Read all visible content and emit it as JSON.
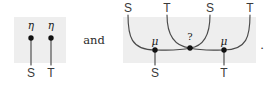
{
  "figure": {
    "type": "string-diagram-pair",
    "conjunction": "and",
    "terminator": ".",
    "background_color": "#ffffff",
    "panel_color": "#eeeeee",
    "stroke_color": "#3a3a3a",
    "node_color": "#111111"
  },
  "left_diagram": {
    "name": "unit-diagram",
    "panel": {
      "x": 14,
      "y": 17,
      "width": 52,
      "height": 46
    },
    "top_nodes": [
      {
        "label": "η",
        "name": "eta-node-s",
        "x": 31,
        "y": 38
      },
      {
        "label": "η",
        "name": "eta-node-t",
        "x": 51,
        "y": 38
      }
    ],
    "bottom_labels": [
      {
        "label": "S",
        "name": "output-label-s",
        "x": 31,
        "y": 72
      },
      {
        "label": "T",
        "name": "output-label-t",
        "x": 51,
        "y": 72
      }
    ],
    "wires": [
      {
        "name": "wire-eta-s",
        "from": [
          31,
          38
        ],
        "to": [
          31,
          65
        ]
      },
      {
        "name": "wire-eta-t",
        "from": [
          51,
          38
        ],
        "to": [
          51,
          65
        ]
      }
    ]
  },
  "right_diagram": {
    "name": "multiplication-diagram",
    "panel": {
      "x": 123,
      "y": 17,
      "width": 133,
      "height": 46
    },
    "top_labels": [
      {
        "label": "S",
        "name": "input-label-s1",
        "x": 128,
        "y": 9
      },
      {
        "label": "T",
        "name": "input-label-t1",
        "x": 167,
        "y": 9
      },
      {
        "label": "S",
        "name": "input-label-s2",
        "x": 210,
        "y": 9
      },
      {
        "label": "T",
        "name": "input-label-t2",
        "x": 250,
        "y": 9
      }
    ],
    "bottom_labels": [
      {
        "label": "S",
        "name": "output-label-s",
        "x": 155,
        "y": 72
      },
      {
        "label": "T",
        "name": "output-label-t",
        "x": 224,
        "y": 72
      }
    ],
    "nodes": [
      {
        "label": "μ",
        "name": "mu-node-left",
        "x": 155,
        "y": 50,
        "label_x": 155,
        "label_y": 41
      },
      {
        "label": "?",
        "name": "crossing-node",
        "x": 190,
        "y": 48,
        "label_x": 190,
        "label_y": 38
      },
      {
        "label": "μ",
        "name": "mu-node-right",
        "x": 224,
        "y": 50,
        "label_x": 224,
        "label_y": 41
      }
    ]
  }
}
